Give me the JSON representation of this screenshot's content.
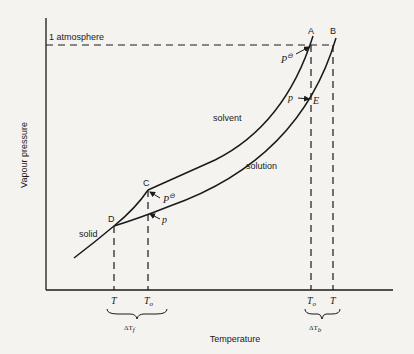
{
  "figure": {
    "axes": {
      "y_label": "Vapour pressure",
      "x_label": "Temperature",
      "reference_line_label": "1 atmosphere"
    },
    "curves": {
      "solvent": "solvent",
      "solution": "solution",
      "solid": "solid"
    },
    "points": {
      "A": "A",
      "B": "B",
      "C": "C",
      "D": "D",
      "E": "E"
    },
    "pressure_labels": {
      "p_standard_A": "P",
      "p_standard_C": "P",
      "p_solution_E": "p",
      "p_solution_C": "p",
      "standard_symbol": "⊖"
    },
    "x_ticks": {
      "freeze_T": "T",
      "freeze_T0": "T",
      "freeze_T0_sub": "o",
      "boil_T0": "T",
      "boil_T0_sub": "o",
      "boil_T": "T"
    },
    "deltas": {
      "freezing": "ΔT",
      "freezing_sub": "f",
      "boiling": "ΔT",
      "boiling_sub": "b"
    }
  },
  "colors": {
    "background": "#f4f3f0",
    "ink": "#1a1a1a"
  }
}
